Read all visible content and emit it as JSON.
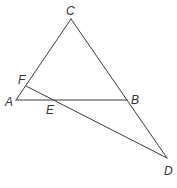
{
  "diagram": {
    "type": "geometry",
    "stroke_color": "#3a3a3a",
    "label_color": "#333333",
    "points": {
      "A": {
        "label": "A",
        "x": 16,
        "y": 100,
        "lx": 6,
        "ly": 106
      },
      "B": {
        "label": "B",
        "x": 127,
        "y": 100,
        "lx": 131,
        "ly": 104
      },
      "C": {
        "label": "C",
        "x": 71,
        "y": 19,
        "lx": 66,
        "ly": 15
      },
      "D": {
        "label": "D",
        "x": 167,
        "y": 158,
        "lx": 164,
        "ly": 175
      },
      "E": {
        "label": "E",
        "x": 55,
        "y": 100,
        "lx": 46,
        "ly": 114
      },
      "F": {
        "label": "F",
        "x": 26,
        "y": 86,
        "lx": 18,
        "ly": 84
      }
    },
    "segments": [
      {
        "name": "segment-CA",
        "from": "C",
        "to": "A"
      },
      {
        "name": "segment-AB",
        "from": "A",
        "to": "B"
      },
      {
        "name": "segment-CD",
        "from": "C",
        "to": "D"
      },
      {
        "name": "segment-FD",
        "from": "F",
        "to": "D"
      }
    ]
  }
}
